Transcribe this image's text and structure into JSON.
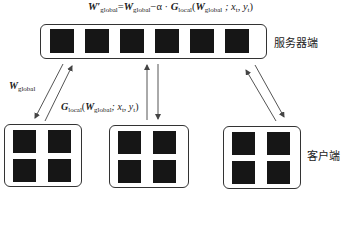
{
  "formula": {
    "lhs": "W′",
    "lhs_sub": "global",
    "w": "W",
    "w_sub": "global",
    "minus_alpha": "−α · ",
    "g": "G",
    "g_sub": "local",
    "open": "(",
    "w2": "W",
    "w2_sub": "global",
    "args": " ; x",
    "xt_sub": "t",
    "comma": ", y",
    "yt_sub": "t",
    "close": ")"
  },
  "server": {
    "label": "服务器端",
    "param_blocks": 6
  },
  "clients": {
    "label": "客户端",
    "count": 3,
    "param_blocks_each": 4
  },
  "arrow_labels": {
    "download": {
      "symbol": "W",
      "sub": "global"
    },
    "upload": {
      "symbol": "G",
      "sub": "local",
      "open": "(",
      "w": "W",
      "w_sub": "global",
      "args": "; x",
      "xt_sub": "t",
      "comma": ", y",
      "yt_sub": "t",
      "close": ")"
    }
  },
  "colors": {
    "block_fill": "#161616",
    "box_border": "#333333",
    "arrow": "#555555"
  }
}
